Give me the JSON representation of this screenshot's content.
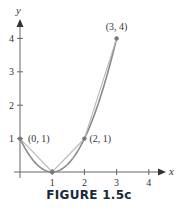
{
  "figure": {
    "caption": "FIGURE 1.5c"
  },
  "chart_data": {
    "type": "line",
    "title": "",
    "xlabel": "x",
    "ylabel": "y",
    "xlim": [
      0,
      4.5
    ],
    "ylim": [
      0,
      4.5
    ],
    "grid": false,
    "x_ticks": [
      "1",
      "2",
      "3",
      "4"
    ],
    "y_ticks": [
      "1",
      "2",
      "3",
      "4"
    ],
    "series": [
      {
        "name": "curve y = (x-1)^2",
        "x": [
          0,
          0.5,
          1,
          1.5,
          2,
          2.5,
          3
        ],
        "y": [
          1,
          0.25,
          0,
          0.25,
          1,
          2.25,
          4
        ],
        "color": "#8a8a8a"
      },
      {
        "name": "polygonal approximation",
        "x": [
          0,
          1,
          2,
          3
        ],
        "y": [
          1,
          0,
          1,
          4
        ],
        "color": "#b8b8b8"
      }
    ],
    "annotations": [
      {
        "label": "(0, 1)",
        "x": 0,
        "y": 1
      },
      {
        "label": "(2, 1)",
        "x": 2,
        "y": 1
      },
      {
        "label": "(3, 4)",
        "x": 3,
        "y": 4
      }
    ]
  }
}
